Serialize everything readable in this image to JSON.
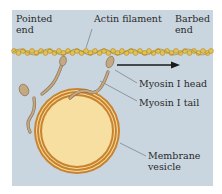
{
  "diagram": {
    "labels": {
      "pointed_end": "Pointed\nend",
      "actin_filament": "Actin filament",
      "barbed_end": "Barbed\nend",
      "myosin_head": "Myosin I head",
      "myosin_tail": "Myosin I tail",
      "membrane_vesicle": "Membrane\nvesicle"
    },
    "colors": {
      "background": "#c9d6e0",
      "actin": "#e8c24a",
      "actin_outline": "#a8862a",
      "myosin": "#c4a882",
      "myosin_outline": "#8a7050",
      "vesicle_membrane": "#c9822e",
      "vesicle_inner": "#f6dfa0",
      "arrow": "#1a1a1a"
    },
    "direction_arrow": "toward barbed end"
  }
}
